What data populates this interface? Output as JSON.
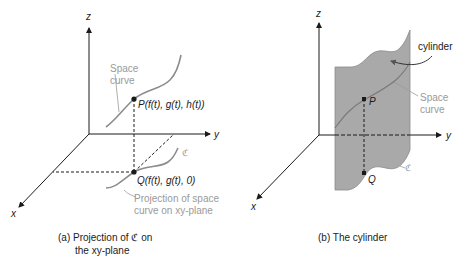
{
  "panel_a": {
    "axis_z": "z",
    "axis_y": "y",
    "axis_x": "x",
    "space_curve_label_1": "Space",
    "space_curve_label_2": "curve",
    "point_p": "P(f(t), g(t), h(t))",
    "point_q": "Q(f(t), g(t), 0)",
    "curve_c": "ℭ",
    "projection_label_1": "Projection of space",
    "projection_label_2": "curve on xy-plane",
    "caption_1": "(a) Projection of ℭ on",
    "caption_2": "the xy-plane"
  },
  "panel_b": {
    "axis_z": "z",
    "axis_y": "y",
    "axis_x": "x",
    "cylinder_label": "cylinder",
    "space_curve_label_1": "Space",
    "space_curve_label_2": "curve",
    "point_p": "P",
    "point_q": "Q",
    "curve_c": "ℭ",
    "caption": "(b) The cylinder"
  },
  "colors": {
    "axis": "#1a1a1a",
    "curve": "#8c8c8c",
    "label_gray": "#9a9a9a",
    "cylinder_fill": "#a9a9a9"
  }
}
